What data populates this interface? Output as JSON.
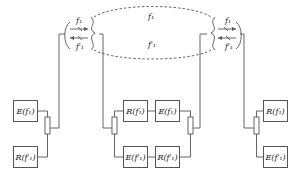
{
  "diagram": {
    "type": "full-duplex radio link block diagram",
    "link": {
      "upper_label": "f1",
      "lower_label": "f1'",
      "style": "dashed ellipse"
    },
    "left_antenna": {
      "tx_label": "f1",
      "rx_label": "f1'"
    },
    "right_antenna": {
      "tx_label": "f1",
      "rx_label": "f1'"
    },
    "stations": [
      {
        "name": "left-station",
        "top": "E(f1)",
        "bottom": "R(f1')"
      },
      {
        "name": "middle-station-left",
        "top": "R(f1)",
        "bottom": "E(f1')"
      },
      {
        "name": "middle-station-right",
        "top": "E(f1)",
        "bottom": "R(f1')"
      },
      {
        "name": "right-station",
        "top": "R(f1)",
        "bottom": "E(f1')"
      }
    ]
  },
  "labels": {
    "E_f1": "E(f₁)",
    "R_f1": "R(f₁)",
    "E_f1p": "E(f′₁)",
    "R_f1p": "R(f′₁)",
    "f1": "f₁",
    "f1p": "f′₁"
  }
}
